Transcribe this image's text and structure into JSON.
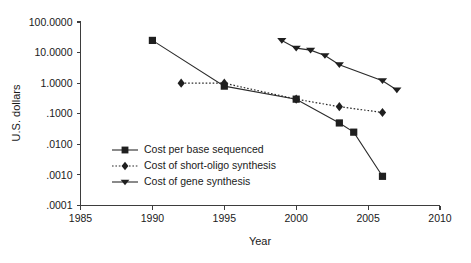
{
  "chart_data": {
    "type": "line",
    "title": "",
    "xlabel": "Year",
    "ylabel": "U.S. dollars",
    "xlim": [
      1985,
      2010
    ],
    "ylim": [
      0.0001,
      100
    ],
    "yscale": "log",
    "grid": false,
    "legend_position": "inside-lower-left",
    "xticks": [
      "1985",
      "1990",
      "1995",
      "2000",
      "2005",
      "2010"
    ],
    "xtick_values": [
      1985,
      1990,
      1995,
      2000,
      2005,
      2010
    ],
    "yticks": [
      "100.0000",
      "10.0000",
      "1.0000",
      ".1000",
      ".0100",
      ".0010",
      ".0001"
    ],
    "ytick_values": [
      100,
      10,
      1,
      0.1,
      0.01,
      0.001,
      0.0001
    ],
    "series": [
      {
        "name": "Cost per base sequenced",
        "marker": "square",
        "linestyle": "solid",
        "x": [
          1990,
          1995,
          2000,
          2003,
          2004,
          2006
        ],
        "values": [
          25,
          0.8,
          0.3,
          0.05,
          0.025,
          0.0009
        ]
      },
      {
        "name": "Cost of short-oligo synthesis",
        "marker": "diamond",
        "linestyle": "dotted",
        "x": [
          1992,
          1995,
          2000,
          2003,
          2006
        ],
        "values": [
          1.0,
          1.0,
          0.3,
          0.17,
          0.11
        ]
      },
      {
        "name": "Cost of gene synthesis",
        "marker": "triangle-down",
        "linestyle": "solid",
        "x": [
          1999,
          2000,
          2001,
          2002,
          2003,
          2006,
          2007
        ],
        "values": [
          25,
          14,
          12,
          8,
          4,
          1.2,
          0.6
        ]
      }
    ]
  },
  "legend": {
    "items": [
      {
        "label": "Cost per base sequenced"
      },
      {
        "label": "Cost of short-oligo synthesis"
      },
      {
        "label": "Cost of gene synthesis"
      }
    ]
  },
  "colors": {
    "ink": "#1f1f1f",
    "axis": "#3d3d3d",
    "background": "#ffffff"
  }
}
